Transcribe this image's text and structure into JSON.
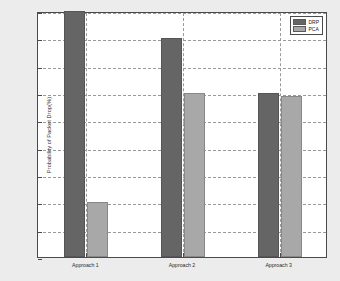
{
  "chart_data": {
    "type": "bar",
    "title": "",
    "xlabel": "",
    "ylabel": "Probability of Packet Drop(%)",
    "categories": [
      "Approach 1",
      "Approach 2",
      "Approach 3"
    ],
    "series": [
      {
        "name": "DRP",
        "color": "#656565",
        "values": [
          0.45,
          0.4,
          0.3
        ]
      },
      {
        "name": "PCA",
        "color": "#a8a8a8",
        "values": [
          0.1,
          0.3,
          0.295
        ]
      }
    ],
    "ylim": [
      0,
      0.45
    ],
    "ytick_labels": [
      "0",
      "0.05",
      "0.1",
      "0.15",
      "0.2",
      "0.25",
      "0.3",
      "0.35",
      "0.4",
      "0.45"
    ],
    "ytick_values": [
      0,
      0.05,
      0.1,
      0.15,
      0.2,
      0.25,
      0.3,
      0.35,
      0.4,
      0.45
    ],
    "grid": true,
    "grid_style": "dashed",
    "legend_position": "top-right",
    "background": "#ececec",
    "plot_background": "#ffffff"
  },
  "legend": {
    "items": [
      {
        "label": "DRP"
      },
      {
        "label": "PCA"
      }
    ]
  }
}
